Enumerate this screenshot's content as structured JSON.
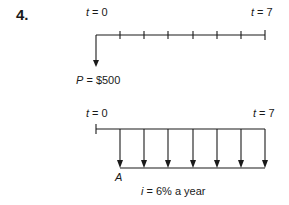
{
  "problem_number": "4.",
  "diagram_top": {
    "start_label_var": "t",
    "start_label_rest": " = 0",
    "end_label_var": "t",
    "end_label_rest": " = 7",
    "periods": 7,
    "arrow_label_var": "P",
    "arrow_label_rest": " = $500"
  },
  "diagram_bottom": {
    "start_label_var": "t",
    "start_label_rest": " = 0",
    "end_label_var": "t",
    "end_label_rest": " = 7",
    "periods": 7,
    "annuity_label": "A",
    "rate_label_var": "i",
    "rate_label_rest": " = 6% a year"
  },
  "colors": {
    "ink": "#1a1a1a",
    "background": "#ffffff"
  }
}
